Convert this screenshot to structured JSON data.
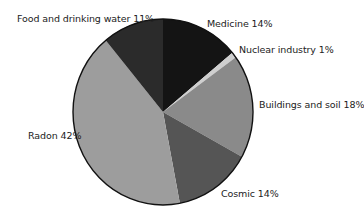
{
  "chart_data": {
    "type": "pie",
    "title": "",
    "start_angle_deg": 0,
    "direction": "clockwise",
    "slices": [
      {
        "label": "Medicine",
        "value": 14,
        "display": "Medicine 14%",
        "color": "#141414"
      },
      {
        "label": "Nuclear industry",
        "value": 1,
        "display": "Nuclear industry 1%",
        "color": "#cfcfcf"
      },
      {
        "label": "Buildings and soil",
        "value": 18,
        "display": "Buildings and soil 18%",
        "color": "#8a8a8a"
      },
      {
        "label": "Cosmic",
        "value": 14,
        "display": "Cosmic 14%",
        "color": "#555555"
      },
      {
        "label": "Radon",
        "value": 42,
        "display": "Radon 42%",
        "color": "#9d9d9d"
      },
      {
        "label": "Food and drinking water",
        "value": 11,
        "display": "Food and drinking water 11%",
        "color": "#2b2b2b"
      }
    ],
    "legend": "none (direct labels)"
  },
  "labels": {
    "medicine": "Medicine 14%",
    "nuclear": "Nuclear industry 1%",
    "buildings": "Buildings and soil 18%",
    "cosmic": "Cosmic 14%",
    "radon": "Radon 42%",
    "food": "Food and drinking water 11%"
  }
}
